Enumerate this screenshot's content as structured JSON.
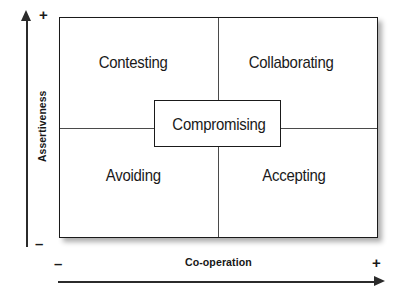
{
  "chart_data": {
    "type": "scatter",
    "xlabel": "Co-operation",
    "ylabel": "Assertiveness",
    "x_axis": {
      "label": "Co-operation",
      "min_sign": "–",
      "max_sign": "+",
      "arrow": "right"
    },
    "y_axis": {
      "label": "Assertiveness",
      "min_sign": "–",
      "max_sign": "+",
      "arrow": "up"
    },
    "grid": true,
    "legend": "none",
    "quadrants": [
      {
        "name": "contesting",
        "label": "Contesting",
        "assertiveness": "high",
        "cooperation": "low"
      },
      {
        "name": "collaborating",
        "label": "Collaborating",
        "assertiveness": "high",
        "cooperation": "high"
      },
      {
        "name": "avoiding",
        "label": "Avoiding",
        "assertiveness": "low",
        "cooperation": "low"
      },
      {
        "name": "accepting",
        "label": "Accepting",
        "assertiveness": "low",
        "cooperation": "high"
      }
    ],
    "center": {
      "name": "compromising",
      "label": "Compromising",
      "assertiveness": "medium",
      "cooperation": "medium"
    }
  },
  "matrix": {
    "quadrant_top_left": "Contesting",
    "quadrant_top_right": "Collaborating",
    "quadrant_bottom_left": "Avoiding",
    "quadrant_bottom_right": "Accepting",
    "center_label": "Compromising"
  },
  "axes": {
    "vertical_label": "Assertiveness",
    "vertical_plus": "+",
    "vertical_minus": "–",
    "horizontal_label": "Co-operation",
    "horizontal_plus": "+",
    "horizontal_minus": "–"
  },
  "colors": {
    "line": "#1a1a1a",
    "divider": "#4a4a4a",
    "text": "#1a1a1a",
    "background": "#ffffff"
  }
}
